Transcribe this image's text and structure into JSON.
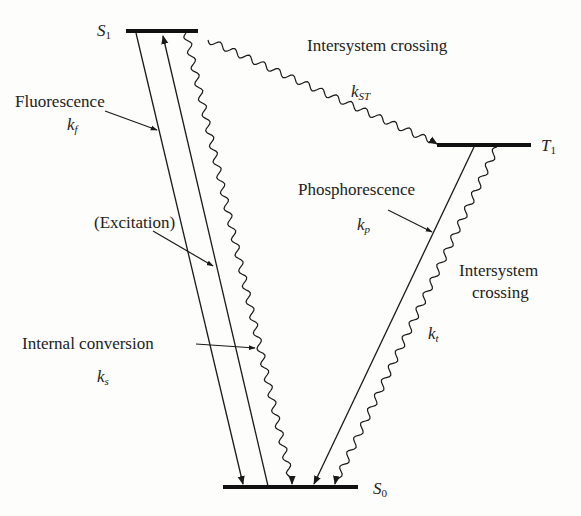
{
  "diagram": {
    "type": "Jablonski energy level diagram",
    "levels": [
      {
        "id": "S1",
        "symbol": "S",
        "subscript": "1",
        "label": "S1"
      },
      {
        "id": "T1",
        "symbol": "T",
        "subscript": "1",
        "label": "T1"
      },
      {
        "id": "S0",
        "symbol": "S",
        "subscript": "0",
        "label": "S0"
      }
    ],
    "processes": [
      {
        "name": "Fluorescence",
        "rate_symbol": "k",
        "rate_subscript": "f",
        "from": "S1",
        "to": "S0",
        "style": "straight"
      },
      {
        "name": "(Excitation)",
        "from": "S0",
        "to": "S1",
        "style": "straight"
      },
      {
        "name": "Internal conversion",
        "rate_symbol": "k",
        "rate_subscript": "s",
        "from": "S1",
        "to": "S0",
        "style": "wavy"
      },
      {
        "name": "Intersystem crossing",
        "rate_symbol": "k",
        "rate_subscript": "ST",
        "from": "S1",
        "to": "T1",
        "style": "wavy"
      },
      {
        "name": "Phosphorescence",
        "rate_symbol": "k",
        "rate_subscript": "p",
        "from": "T1",
        "to": "S0",
        "style": "straight"
      },
      {
        "name_line1": "Intersystem",
        "name_line2": "crossing",
        "rate_symbol": "k",
        "rate_subscript": "t",
        "from": "T1",
        "to": "S0",
        "style": "wavy"
      }
    ]
  },
  "colors": {
    "ink": "#1a1a1a",
    "background": "#fdfdfb"
  }
}
